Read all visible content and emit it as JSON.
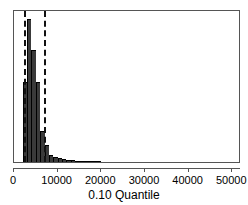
{
  "chart_data": {
    "type": "bar",
    "title": "",
    "xlabel": "0.10 Quantile",
    "ylabel": "",
    "xlim": [
      0,
      52000
    ],
    "ylim": [
      0,
      1
    ],
    "grid": false,
    "legend": null,
    "x_ticks": [
      0,
      10000,
      20000,
      30000,
      40000,
      50000
    ],
    "x_tick_labels": [
      "0",
      "10000",
      "20000",
      "30000",
      "40000",
      "50000"
    ],
    "bin_width": 1000,
    "bar_color": "#3a3a3a",
    "bins": [
      {
        "x0": 2000,
        "x1": 3000,
        "height": 0.56
      },
      {
        "x0": 3000,
        "x1": 4000,
        "height": 1.0
      },
      {
        "x0": 4000,
        "x1": 5000,
        "height": 0.78
      },
      {
        "x0": 5000,
        "x1": 6000,
        "height": 0.56
      },
      {
        "x0": 6000,
        "x1": 7000,
        "height": 0.22
      },
      {
        "x0": 7000,
        "x1": 8000,
        "height": 0.12
      },
      {
        "x0": 8000,
        "x1": 9000,
        "height": 0.05
      },
      {
        "x0": 9000,
        "x1": 10000,
        "height": 0.035
      },
      {
        "x0": 10000,
        "x1": 11000,
        "height": 0.025
      },
      {
        "x0": 11000,
        "x1": 12000,
        "height": 0.018
      },
      {
        "x0": 12000,
        "x1": 13000,
        "height": 0.014
      },
      {
        "x0": 13000,
        "x1": 14000,
        "height": 0.011
      },
      {
        "x0": 14000,
        "x1": 15000,
        "height": 0.009
      },
      {
        "x0": 15000,
        "x1": 16000,
        "height": 0.008
      },
      {
        "x0": 16000,
        "x1": 17000,
        "height": 0.007
      },
      {
        "x0": 17000,
        "x1": 18000,
        "height": 0.006
      },
      {
        "x0": 18000,
        "x1": 19000,
        "height": 0.006
      },
      {
        "x0": 19000,
        "x1": 20000,
        "height": 0.005
      }
    ],
    "reference_lines": [
      {
        "name": "lower-reference-line",
        "x": 2250,
        "style": "dashed",
        "color": "#111111"
      },
      {
        "name": "upper-reference-line",
        "x": 6800,
        "style": "dashed",
        "color": "#111111"
      }
    ]
  }
}
